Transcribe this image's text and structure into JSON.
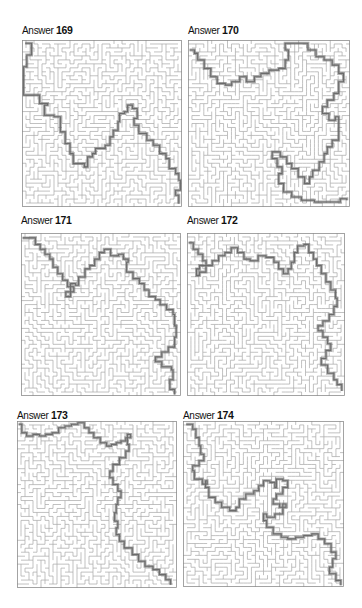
{
  "colors": {
    "background": "#ffffff",
    "wall": "#a6a6a6",
    "border": "#8c8c8c",
    "solution": "#6b6b6b",
    "title": "#111111"
  },
  "panels": [
    {
      "label": "Answer",
      "number": "169",
      "title_pos": [
        22,
        24
      ],
      "box": [
        22,
        40,
        160,
        167
      ],
      "seed": 169,
      "path": [
        [
          2,
          2
        ],
        [
          6,
          2
        ],
        [
          6,
          9
        ],
        [
          3,
          11
        ],
        [
          3,
          16
        ],
        [
          1,
          17
        ],
        [
          1,
          33
        ],
        [
          10,
          33
        ],
        [
          11,
          38
        ],
        [
          16,
          39
        ],
        [
          14,
          45
        ],
        [
          20,
          46
        ],
        [
          24,
          55
        ],
        [
          27,
          62
        ],
        [
          30,
          68
        ],
        [
          32,
          74
        ],
        [
          39,
          76
        ],
        [
          41,
          70
        ],
        [
          44,
          68
        ],
        [
          46,
          65
        ],
        [
          52,
          63
        ],
        [
          55,
          58
        ],
        [
          57,
          54
        ],
        [
          60,
          49
        ],
        [
          61,
          44
        ],
        [
          64,
          43
        ],
        [
          66,
          39
        ],
        [
          69,
          41
        ],
        [
          72,
          47
        ],
        [
          70,
          51
        ],
        [
          73,
          56
        ],
        [
          78,
          60
        ],
        [
          82,
          63
        ],
        [
          86,
          68
        ],
        [
          90,
          71
        ],
        [
          92,
          77
        ],
        [
          96,
          80
        ],
        [
          98,
          84
        ],
        [
          99,
          90
        ],
        [
          96,
          93
        ],
        [
          98,
          98
        ]
      ]
    },
    {
      "label": "Answer",
      "number": "170",
      "title_pos": [
        188,
        24
      ],
      "box": [
        188,
        40,
        162,
        167
      ],
      "seed": 170,
      "path": [
        [
          1,
          6
        ],
        [
          4,
          8
        ],
        [
          6,
          12
        ],
        [
          10,
          17
        ],
        [
          14,
          22
        ],
        [
          18,
          26
        ],
        [
          23,
          27
        ],
        [
          27,
          25
        ],
        [
          32,
          22
        ],
        [
          36,
          25
        ],
        [
          41,
          22
        ],
        [
          45,
          20
        ],
        [
          50,
          18
        ],
        [
          56,
          17
        ],
        [
          60,
          12
        ],
        [
          62,
          6
        ],
        [
          60,
          2
        ],
        [
          70,
          2
        ],
        [
          74,
          6
        ],
        [
          79,
          10
        ],
        [
          84,
          12
        ],
        [
          89,
          15
        ],
        [
          93,
          20
        ],
        [
          96,
          25
        ],
        [
          93,
          32
        ],
        [
          90,
          36
        ],
        [
          86,
          40
        ],
        [
          83,
          44
        ],
        [
          87,
          48
        ],
        [
          91,
          46
        ],
        [
          93,
          52
        ],
        [
          93,
          60
        ],
        [
          89,
          64
        ],
        [
          86,
          68
        ],
        [
          84,
          73
        ],
        [
          81,
          78
        ],
        [
          77,
          82
        ],
        [
          75,
          86
        ],
        [
          72,
          82
        ],
        [
          68,
          77
        ],
        [
          64,
          74
        ],
        [
          61,
          70
        ],
        [
          57,
          67
        ],
        [
          52,
          71
        ],
        [
          55,
          76
        ],
        [
          58,
          80
        ],
        [
          56,
          86
        ],
        [
          59,
          91
        ],
        [
          64,
          94
        ],
        [
          70,
          96
        ],
        [
          78,
          97
        ],
        [
          86,
          97
        ],
        [
          94,
          95
        ],
        [
          98,
          96
        ]
      ]
    },
    {
      "label": "Answer",
      "number": "171",
      "title_pos": [
        21,
        214
      ],
      "box": [
        21,
        233,
        160,
        163
      ],
      "seed": 171,
      "path": [
        [
          1,
          3
        ],
        [
          6,
          3
        ],
        [
          9,
          7
        ],
        [
          12,
          10
        ],
        [
          15,
          13
        ],
        [
          18,
          16
        ],
        [
          20,
          21
        ],
        [
          23,
          25
        ],
        [
          26,
          29
        ],
        [
          29,
          33
        ],
        [
          33,
          36
        ],
        [
          28,
          39
        ],
        [
          31,
          31
        ],
        [
          34,
          32
        ],
        [
          36,
          27
        ],
        [
          40,
          22
        ],
        [
          43,
          20
        ],
        [
          46,
          16
        ],
        [
          49,
          12
        ],
        [
          52,
          10
        ],
        [
          56,
          14
        ],
        [
          61,
          13
        ],
        [
          64,
          16
        ],
        [
          67,
          18
        ],
        [
          66,
          24
        ],
        [
          70,
          28
        ],
        [
          74,
          31
        ],
        [
          77,
          35
        ],
        [
          80,
          39
        ],
        [
          84,
          41
        ],
        [
          87,
          44
        ],
        [
          91,
          47
        ],
        [
          95,
          50
        ],
        [
          96,
          57
        ],
        [
          97,
          64
        ],
        [
          96,
          70
        ],
        [
          92,
          73
        ],
        [
          88,
          76
        ],
        [
          84,
          79
        ],
        [
          88,
          82
        ],
        [
          94,
          84
        ],
        [
          95,
          90
        ],
        [
          93,
          96
        ],
        [
          96,
          99
        ]
      ]
    },
    {
      "label": "Answer",
      "number": "172",
      "title_pos": [
        187,
        214
      ],
      "box": [
        187,
        233,
        158,
        163
      ],
      "seed": 172,
      "path": [
        [
          1,
          6
        ],
        [
          4,
          10
        ],
        [
          7,
          13
        ],
        [
          10,
          17
        ],
        [
          12,
          20
        ],
        [
          8,
          22
        ],
        [
          6,
          26
        ],
        [
          8,
          24
        ],
        [
          12,
          20
        ],
        [
          16,
          17
        ],
        [
          20,
          14
        ],
        [
          24,
          12
        ],
        [
          28,
          9
        ],
        [
          32,
          12
        ],
        [
          36,
          16
        ],
        [
          40,
          17
        ],
        [
          45,
          14
        ],
        [
          50,
          15
        ],
        [
          55,
          18
        ],
        [
          58,
          22
        ],
        [
          61,
          25
        ],
        [
          64,
          22
        ],
        [
          66,
          18
        ],
        [
          68,
          12
        ],
        [
          70,
          8
        ],
        [
          74,
          7
        ],
        [
          77,
          12
        ],
        [
          80,
          16
        ],
        [
          82,
          20
        ],
        [
          85,
          25
        ],
        [
          88,
          30
        ],
        [
          91,
          35
        ],
        [
          94,
          40
        ],
        [
          95,
          45
        ],
        [
          93,
          50
        ],
        [
          90,
          54
        ],
        [
          86,
          57
        ],
        [
          83,
          60
        ],
        [
          86,
          64
        ],
        [
          89,
          68
        ],
        [
          91,
          72
        ],
        [
          88,
          77
        ],
        [
          85,
          81
        ],
        [
          89,
          86
        ],
        [
          93,
          90
        ],
        [
          95,
          93
        ],
        [
          98,
          97
        ]
      ]
    },
    {
      "label": "Answer",
      "number": "173",
      "title_pos": [
        17,
        409
      ],
      "box": [
        17,
        421,
        160,
        167
      ],
      "seed": 173,
      "path": [
        [
          1,
          2
        ],
        [
          3,
          7
        ],
        [
          6,
          9
        ],
        [
          10,
          8
        ],
        [
          14,
          9
        ],
        [
          18,
          8
        ],
        [
          22,
          7
        ],
        [
          26,
          4
        ],
        [
          30,
          3
        ],
        [
          34,
          2
        ],
        [
          38,
          1
        ],
        [
          42,
          4
        ],
        [
          45,
          7
        ],
        [
          48,
          10
        ],
        [
          52,
          13
        ],
        [
          56,
          15
        ],
        [
          59,
          14
        ],
        [
          62,
          13
        ],
        [
          65,
          12
        ],
        [
          68,
          10
        ],
        [
          71,
          8
        ],
        [
          69,
          14
        ],
        [
          70,
          18
        ],
        [
          68,
          22
        ],
        [
          64,
          26
        ],
        [
          60,
          30
        ],
        [
          58,
          34
        ],
        [
          60,
          38
        ],
        [
          63,
          42
        ],
        [
          65,
          46
        ],
        [
          63,
          50
        ],
        [
          62,
          55
        ],
        [
          61,
          60
        ],
        [
          63,
          64
        ],
        [
          62,
          68
        ],
        [
          64,
          72
        ],
        [
          67,
          76
        ],
        [
          72,
          80
        ],
        [
          76,
          84
        ],
        [
          80,
          87
        ],
        [
          85,
          89
        ],
        [
          89,
          92
        ],
        [
          93,
          95
        ],
        [
          96,
          98
        ]
      ]
    },
    {
      "label": "Answer",
      "number": "174",
      "title_pos": [
        183,
        409
      ],
      "box": [
        183,
        421,
        161,
        166
      ],
      "seed": 174,
      "path": [
        [
          2,
          2
        ],
        [
          6,
          5
        ],
        [
          8,
          10
        ],
        [
          10,
          15
        ],
        [
          11,
          20
        ],
        [
          13,
          24
        ],
        [
          10,
          27
        ],
        [
          6,
          30
        ],
        [
          7,
          35
        ],
        [
          12,
          38
        ],
        [
          15,
          36
        ],
        [
          14,
          40
        ],
        [
          16,
          46
        ],
        [
          20,
          49
        ],
        [
          24,
          52
        ],
        [
          29,
          54
        ],
        [
          33,
          52
        ],
        [
          35,
          47
        ],
        [
          39,
          44
        ],
        [
          44,
          42
        ],
        [
          47,
          39
        ],
        [
          50,
          36
        ],
        [
          54,
          37
        ],
        [
          57,
          40
        ],
        [
          58,
          35
        ],
        [
          62,
          36
        ],
        [
          65,
          40
        ],
        [
          62,
          44
        ],
        [
          58,
          47
        ],
        [
          56,
          50
        ],
        [
          60,
          52
        ],
        [
          64,
          50
        ],
        [
          62,
          56
        ],
        [
          57,
          58
        ],
        [
          52,
          56
        ],
        [
          50,
          60
        ],
        [
          52,
          64
        ],
        [
          56,
          68
        ],
        [
          61,
          70
        ],
        [
          65,
          71
        ],
        [
          70,
          70
        ],
        [
          75,
          69
        ],
        [
          80,
          68
        ],
        [
          84,
          71
        ],
        [
          88,
          74
        ],
        [
          92,
          79
        ],
        [
          95,
          83
        ],
        [
          93,
          88
        ],
        [
          91,
          92
        ],
        [
          95,
          96
        ],
        [
          98,
          99
        ]
      ]
    }
  ]
}
